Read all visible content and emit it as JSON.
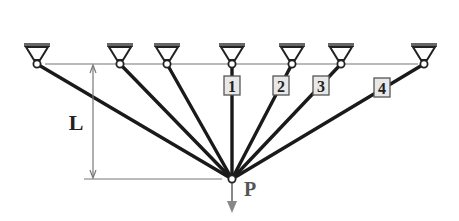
{
  "diagram": {
    "colors": {
      "bar": "#1a1a1a",
      "support": "#666666",
      "thin_line": "#777777",
      "label_box_fill": "#e8e8e8",
      "label_box_stroke": "#555555",
      "load_arrow": "#888888",
      "text": "#222222"
    },
    "support_line_y": 64,
    "joint": {
      "x": 232,
      "y": 179,
      "label": "P"
    },
    "supports": [
      {
        "x": 37
      },
      {
        "x": 120
      },
      {
        "x": 167
      },
      {
        "x": 232
      },
      {
        "x": 292
      },
      {
        "x": 341
      },
      {
        "x": 424
      }
    ],
    "bar_labels": [
      {
        "text": "1",
        "x": 232,
        "y": 86
      },
      {
        "text": "2",
        "x": 281,
        "y": 86
      },
      {
        "text": "3",
        "x": 321,
        "y": 86
      },
      {
        "text": "4",
        "x": 382,
        "y": 88
      }
    ],
    "dimension": {
      "label": "L",
      "x": 93,
      "y_top": 64,
      "y_bottom": 179
    },
    "load": {
      "label": "P",
      "direction": "down"
    }
  }
}
